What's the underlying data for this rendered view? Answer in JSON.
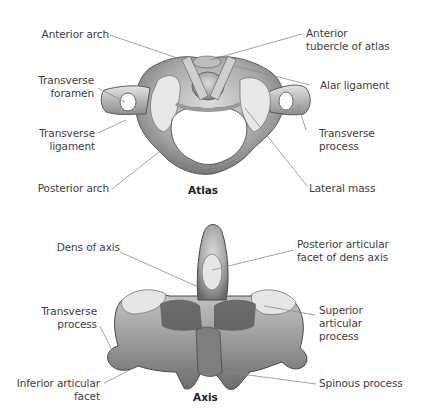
{
  "figure": {
    "atlas": {
      "caption": "Atlas",
      "labels": {
        "anterior_arch": "Anterior arch",
        "anterior_tubercle": [
          "Anterior",
          "tubercle of atlas"
        ],
        "transverse_foramen": [
          "Transverse",
          "foramen"
        ],
        "alar_ligament": "Alar ligament",
        "transverse_ligament": [
          "Transverse",
          "ligament"
        ],
        "transverse_process": [
          "Transverse",
          "process"
        ],
        "posterior_arch": "Posterior arch",
        "lateral_mass": "Lateral mass"
      }
    },
    "axis": {
      "caption": "Axis",
      "labels": {
        "dens": "Dens of axis",
        "posterior_articular_facet": [
          "Posterior articular",
          "facet of dens axis"
        ],
        "transverse_process": [
          "Transverse",
          "process"
        ],
        "superior_articular_process": [
          "Superior",
          "articular",
          "process"
        ],
        "inferior_articular_facet": [
          "Inferior articular",
          "facet"
        ],
        "spinous_process": "Spinous process"
      }
    },
    "colors": {
      "background": "#ffffff",
      "label_text": "#3d3d3d",
      "leader_line": "#8a8a8a",
      "bone_light": "#d8d8d6",
      "bone_mid": "#a9a9a7",
      "bone_dark": "#5e5e5c"
    }
  }
}
